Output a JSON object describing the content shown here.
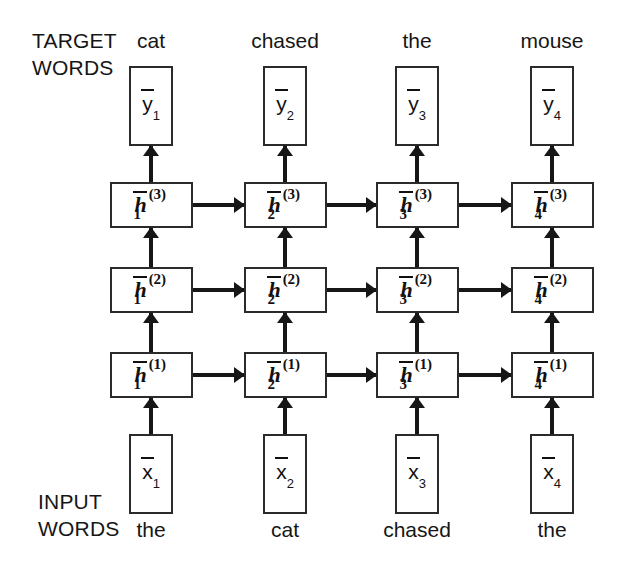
{
  "diagram": {
    "ink_color": "#161616",
    "background": "#ffffff",
    "labels": {
      "target_line1": "TARGET",
      "target_line2": "WORDS",
      "input_line1": "INPUT",
      "input_line2": "WORDS"
    },
    "target_words": [
      "cat",
      "chased",
      "the",
      "mouse"
    ],
    "input_words": [
      "the",
      "cat",
      "chased",
      "the"
    ],
    "output_nodes": [
      {
        "base": "y",
        "sub": "1"
      },
      {
        "base": "y",
        "sub": "2"
      },
      {
        "base": "y",
        "sub": "3"
      },
      {
        "base": "y",
        "sub": "4"
      }
    ],
    "input_nodes": [
      {
        "base": "x",
        "sub": "1"
      },
      {
        "base": "x",
        "sub": "2"
      },
      {
        "base": "x",
        "sub": "3"
      },
      {
        "base": "x",
        "sub": "4"
      }
    ],
    "hidden_layers": [
      {
        "layer": "3",
        "nodes": [
          {
            "base": "h",
            "sub": "1",
            "sup": "(3)"
          },
          {
            "base": "h",
            "sub": "2",
            "sup": "(3)"
          },
          {
            "base": "h",
            "sub": "3",
            "sup": "(3)"
          },
          {
            "base": "h",
            "sub": "4",
            "sup": "(3)"
          }
        ]
      },
      {
        "layer": "2",
        "nodes": [
          {
            "base": "h",
            "sub": "1",
            "sup": "(2)"
          },
          {
            "base": "h",
            "sub": "2",
            "sup": "(2)"
          },
          {
            "base": "h",
            "sub": "3",
            "sup": "(2)"
          },
          {
            "base": "h",
            "sub": "4",
            "sup": "(2)"
          }
        ]
      },
      {
        "layer": "1",
        "nodes": [
          {
            "base": "h",
            "sub": "1",
            "sup": "(1)"
          },
          {
            "base": "h",
            "sub": "2",
            "sup": "(1)"
          },
          {
            "base": "h",
            "sub": "3",
            "sup": "(1)"
          },
          {
            "base": "h",
            "sub": "4",
            "sup": "(1)"
          }
        ]
      }
    ]
  }
}
